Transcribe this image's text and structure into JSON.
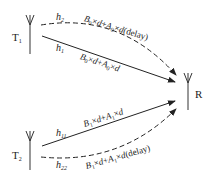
{
  "diagram": {
    "type": "multipath-transmission",
    "nodes": {
      "t1": {
        "label": "T",
        "sub": "1"
      },
      "t2": {
        "label": "T",
        "sub": "2"
      },
      "r": {
        "label": "R"
      }
    },
    "paths": [
      {
        "id": "h2",
        "from": "T1",
        "to": "R",
        "style": "dashed",
        "h_label": "h",
        "h_sub": "2",
        "expr": "B0×d+A0×d(delay)"
      },
      {
        "id": "h1",
        "from": "T1",
        "to": "R",
        "style": "solid",
        "h_label": "h",
        "h_sub": "1",
        "expr": "B0×d+A0×d"
      },
      {
        "id": "h11",
        "from": "T2",
        "to": "R",
        "style": "solid",
        "h_label": "h",
        "h_sub": "11",
        "expr": "B1×d+A1×d"
      },
      {
        "id": "h22",
        "from": "T2",
        "to": "R",
        "style": "dashed",
        "h_label": "h",
        "h_sub": "22",
        "expr": "B1×d+A1×d(delay)"
      }
    ],
    "expr_parts": {
      "b0": "B",
      "s0": "0",
      "a0": "A",
      "b1": "B",
      "s1": "1",
      "a1": "A",
      "times": "×",
      "d": "d",
      "plus": "+",
      "delay": "(delay)"
    },
    "colors": {
      "line": "#222222",
      "text": "#222222",
      "background": "#ffffff"
    }
  }
}
